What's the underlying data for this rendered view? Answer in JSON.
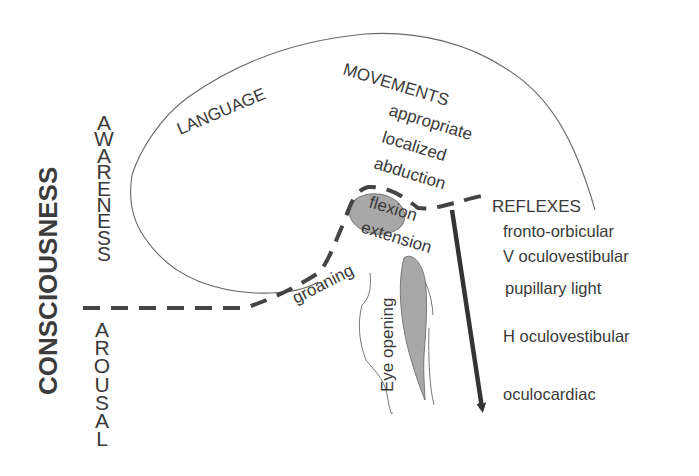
{
  "diagram": {
    "title_vertical": "CONSCIOUSNESS",
    "axis_upper": "AWARENESS",
    "axis_lower": "AROUSAL",
    "cortical_labels": {
      "language": "LANGUAGE",
      "movements": "MOVEMENTS"
    },
    "movements_list": [
      "appropriate",
      "localized",
      "abduction"
    ],
    "motor_responses": {
      "flexion": "flexion",
      "extension": "extension",
      "groaning": "groaning",
      "eye_opening": "Eye opening"
    },
    "reflexes": {
      "heading": "REFLEXES",
      "items": [
        "fronto-orbicular",
        "V oculovestibular",
        "pupillary light",
        "H oculovestibular",
        "oculocardiac"
      ]
    },
    "colors": {
      "text": "#3a3a3a",
      "outline": "#6a6a6a",
      "dashed_boundary": "#444444",
      "shaded_structures": "#a8a8a8",
      "arrow": "#333333",
      "background": "#ffffff"
    }
  }
}
